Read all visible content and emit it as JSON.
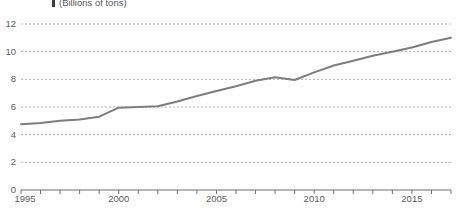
{
  "chart_data": {
    "type": "line",
    "title": "(Billions of tons)",
    "title_marker": "vertical-bar-marker",
    "xlabel": "",
    "ylabel": "",
    "ylim": [
      0,
      12
    ],
    "xlim": [
      1995,
      2017
    ],
    "yticks": [
      0,
      2,
      4,
      6,
      8,
      10,
      12
    ],
    "ytick_labels": [
      "0",
      "2",
      "4",
      "6",
      "8",
      "10",
      "12"
    ],
    "xticks": [
      1995,
      1996,
      1997,
      1998,
      1999,
      2000,
      2001,
      2002,
      2003,
      2004,
      2005,
      2006,
      2007,
      2008,
      2009,
      2010,
      2011,
      2012,
      2013,
      2014,
      2015,
      2016,
      2017
    ],
    "xtick_labels": [
      "1995",
      "2000",
      "2005",
      "2010",
      "2015"
    ],
    "xtick_label_values": [
      1995,
      2000,
      2005,
      2010,
      2015
    ],
    "grid": true,
    "grid_style": "dotted-horizontal",
    "legend": "none",
    "line_color": "#7d7d7d",
    "grid_color": "#b0b0b0",
    "axis_color": "#6e6e6e",
    "x": [
      1995,
      1996,
      1997,
      1998,
      1999,
      2000,
      2001,
      2002,
      2003,
      2004,
      2005,
      2006,
      2007,
      2008,
      2009,
      2010,
      2011,
      2012,
      2013,
      2014,
      2015,
      2016,
      2017
    ],
    "values": [
      4.75,
      4.85,
      5.0,
      5.1,
      5.3,
      5.95,
      6.0,
      6.05,
      6.4,
      6.8,
      7.15,
      7.5,
      7.9,
      8.15,
      7.95,
      8.5,
      9.0,
      9.35,
      9.7,
      10.0,
      10.3,
      10.7,
      11.0
    ],
    "series": [
      {
        "name": "Total",
        "values": [
          4.75,
          4.85,
          5.0,
          5.1,
          5.3,
          5.95,
          6.0,
          6.05,
          6.4,
          6.8,
          7.15,
          7.5,
          7.9,
          8.15,
          7.95,
          8.5,
          9.0,
          9.35,
          9.7,
          10.0,
          10.3,
          10.7,
          11.0
        ]
      }
    ]
  }
}
